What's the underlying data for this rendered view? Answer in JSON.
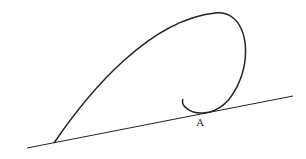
{
  "diagram": {
    "type": "physics-trajectory",
    "colors": {
      "stroke": "#222222",
      "background": "#ffffff"
    },
    "incline": {
      "x1": 27,
      "y1": 148,
      "x2": 293,
      "y2": 96
    },
    "curve": {
      "path": "M54,143 C90,90 150,20 215,13 C245,10 252,50 240,80 C232,100 220,112 203,113 C190,114 180,105 183,99"
    },
    "labels": [
      {
        "id": "point-a",
        "text": "A",
        "x": 200,
        "y": 126
      }
    ]
  }
}
